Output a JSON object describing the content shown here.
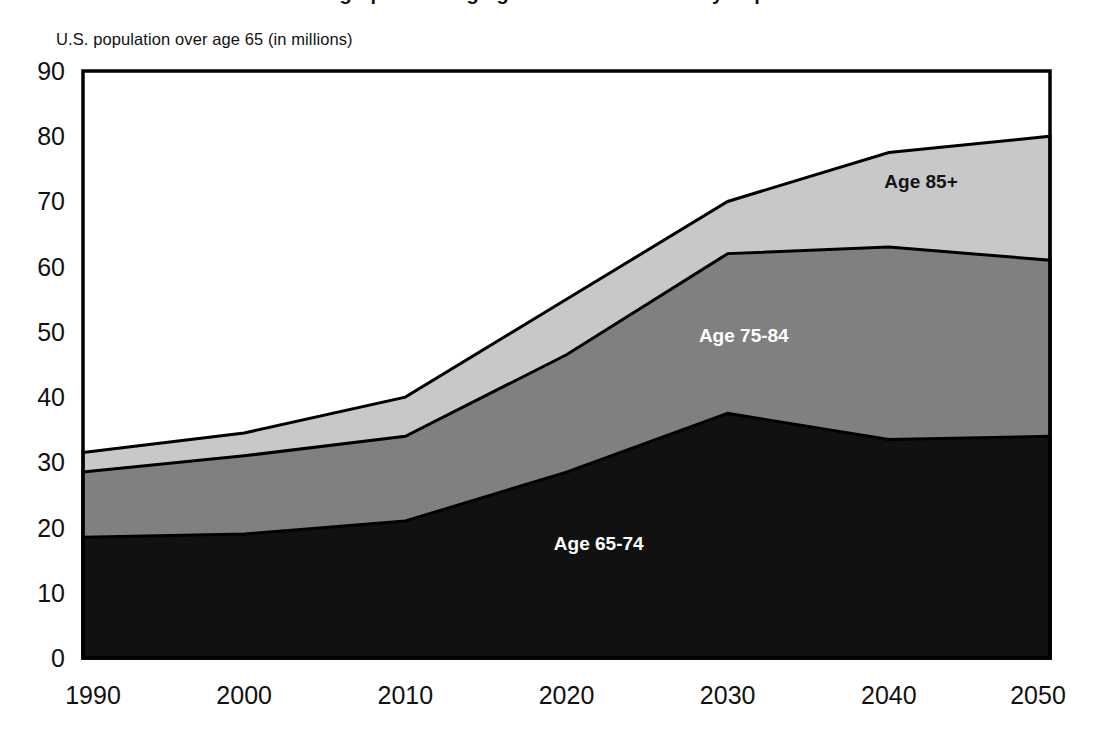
{
  "figure": {
    "clipped_title": "Demographics of Aging: Growth of the Elderly Population",
    "y_axis_caption": "U.S. population over age 65 (in millions)"
  },
  "chart_data": {
    "type": "area",
    "stacked": true,
    "title": "",
    "subtitle": "",
    "xlabel": "",
    "ylabel": "U.S. population over age 65 (in millions)",
    "x": [
      1990,
      2000,
      2010,
      2020,
      2030,
      2040,
      2050
    ],
    "xtick_labels": [
      "1990",
      "2000",
      "2010",
      "2020",
      "2030",
      "2040",
      "2050"
    ],
    "ytick_labels": [
      "0",
      "10",
      "20",
      "30",
      "40",
      "50",
      "60",
      "70",
      "80",
      "90"
    ],
    "ytick_values": [
      0,
      10,
      20,
      30,
      40,
      50,
      60,
      70,
      80,
      90
    ],
    "xlim": [
      1990,
      2050
    ],
    "ylim": [
      0,
      90
    ],
    "grid": false,
    "legend_position": "inline-labels",
    "series": [
      {
        "name": "Age 65-74",
        "color": "#111111",
        "label_color": "#ffffff",
        "values": [
          18.5,
          19,
          21,
          28.5,
          37.5,
          33.5,
          34
        ],
        "cumulative": [
          18.5,
          19,
          21,
          28.5,
          37.5,
          33.5,
          34
        ]
      },
      {
        "name": "Age 75-84",
        "color": "#808080",
        "label_color": "#ffffff",
        "values": [
          10,
          12,
          13,
          18,
          24.5,
          29.5,
          27
        ],
        "cumulative": [
          28.5,
          31,
          34,
          46.5,
          62,
          63,
          61
        ]
      },
      {
        "name": "Age 85+",
        "color": "#c8c8c8",
        "label_color": "#141414",
        "values": [
          3,
          3.5,
          6,
          8.5,
          8,
          14.5,
          19
        ],
        "cumulative": [
          31.5,
          34.5,
          40,
          55,
          70,
          77.5,
          80
        ]
      }
    ],
    "annotations": [
      {
        "text": "Age 85+",
        "x": 2042,
        "y": 72.0,
        "color": "#141414"
      },
      {
        "text": "Age 75-84",
        "x": 2031,
        "y": 48.5,
        "color": "#ffffff"
      },
      {
        "text": "Age 65-74",
        "x": 2022,
        "y": 16.5,
        "color": "#ffffff"
      }
    ],
    "colors": {
      "series_65_74": "#111111",
      "series_75_84": "#808080",
      "series_85_plus": "#c8c8c8",
      "outline": "#000000",
      "background": "#ffffff",
      "text": "#111111"
    }
  }
}
